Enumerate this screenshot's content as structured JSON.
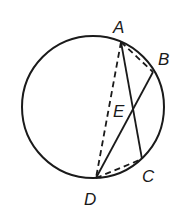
{
  "diagram": {
    "type": "circle-chords",
    "circle": {
      "cx": 93,
      "cy": 107,
      "r": 71
    },
    "points": {
      "A": {
        "x": 121,
        "y": 42
      },
      "B": {
        "x": 153,
        "y": 72
      },
      "C": {
        "x": 142,
        "y": 159
      },
      "D": {
        "x": 96,
        "y": 178
      },
      "E": {
        "x": 133,
        "y": 112
      }
    },
    "labels": {
      "A": "A",
      "B": "B",
      "C": "C",
      "D": "D",
      "E": "E"
    },
    "solid_segments": [
      "AC",
      "BD"
    ],
    "dashed_segments": [
      "AD",
      "AB",
      "DC"
    ],
    "stroke_color": "#1a1a1a"
  }
}
